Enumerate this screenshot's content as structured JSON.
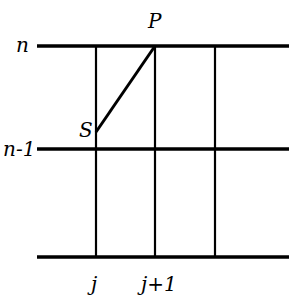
{
  "diagram": {
    "row_labels": {
      "top": "n",
      "middle": "n-1"
    },
    "column_labels": {
      "left": "j",
      "right": "j+1"
    },
    "point_labels": {
      "start": "S",
      "end": "P"
    },
    "colors": {
      "line": "#000000",
      "background": "#ffffff"
    }
  }
}
